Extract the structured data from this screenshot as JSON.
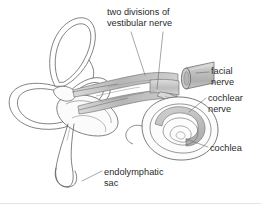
{
  "figure": {
    "background_color": "#ffffff",
    "line_color": "#4a4a4a",
    "shade_color": "#c2c2c2",
    "text_color": "#2a2a2a"
  },
  "labels": {
    "vestibular_nerve": {
      "line1": "two divisions of",
      "line2": "vestibular nerve"
    },
    "facial_nerve": {
      "line1": "facial",
      "line2": "nerve"
    },
    "cochlear_nerve": {
      "line1": "cochlear",
      "line2": "nerve"
    },
    "cochlea": {
      "line1": "cochlea"
    },
    "endolymphatic_sac": {
      "line1": "endolymphatic",
      "line2": "sac"
    }
  }
}
